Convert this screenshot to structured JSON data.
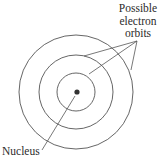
{
  "diagram": {
    "type": "atom-model",
    "labels": {
      "orbits_line1": "Possible",
      "orbits_line2": "electron",
      "orbits_line3": "orbits",
      "nucleus": "Nucleus"
    },
    "colors": {
      "stroke": "#555555",
      "nucleus": "#333333",
      "text": "#2b2b2b"
    },
    "center": [
      76,
      92
    ],
    "orbit_radii": [
      19,
      37,
      57
    ]
  }
}
